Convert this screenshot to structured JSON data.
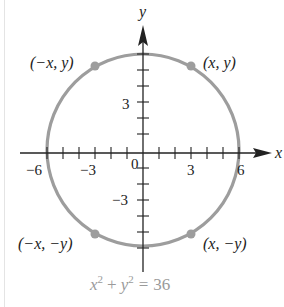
{
  "diagram": {
    "equation": {
      "x_term": "x",
      "x_exp": "2",
      "plus": "+",
      "y_term": "y",
      "y_exp": "2",
      "equals": "=",
      "value": "36",
      "full": "x² + y² = 36"
    },
    "axes": {
      "x_label": "x",
      "y_label": "y",
      "origin_label": "0",
      "x_ticks": [
        -6,
        -5,
        -4,
        -3,
        -2,
        -1,
        1,
        2,
        3,
        4,
        5,
        6
      ],
      "y_ticks": [
        -6,
        -5,
        -4,
        -3,
        -2,
        -1,
        1,
        2,
        3,
        4,
        5,
        6
      ],
      "x_tick_labels": {
        "neg6": "−6",
        "neg3": "−3",
        "pos3": "3",
        "pos6": "6"
      },
      "y_tick_labels": {
        "pos3": "3",
        "neg3": "−3"
      }
    },
    "circle": {
      "center": [
        0,
        0
      ],
      "radius": 6,
      "color": "#9d9d9d"
    },
    "points": {
      "q2": {
        "label": "(−x, y)"
      },
      "q1": {
        "label": "(x, y)"
      },
      "q3": {
        "label": "(−x, −y)"
      },
      "q4": {
        "label": "(x, −y)"
      }
    },
    "colors": {
      "axis": "#222222",
      "curve": "#9d9d9d",
      "equation": "#9a9a9a"
    }
  }
}
